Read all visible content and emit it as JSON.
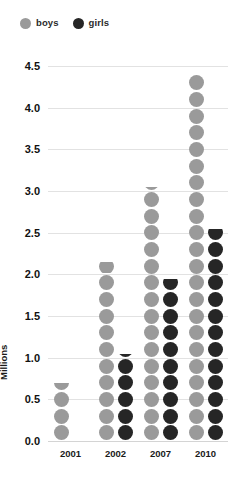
{
  "chart_data": {
    "type": "scatter",
    "title": "",
    "subtitle": "",
    "xlabel": "",
    "ylabel": "Millions",
    "categories": [
      "2001",
      "2002",
      "2007",
      "2010"
    ],
    "ylim": [
      0.0,
      4.5
    ],
    "ytick_labels": [
      "0.0",
      "0.5",
      "1.0",
      "1.5",
      "2.0",
      "2.5",
      "3.0",
      "3.5",
      "4.0",
      "4.5"
    ],
    "ytick_values": [
      0.0,
      0.5,
      1.0,
      1.5,
      2.0,
      2.5,
      3.0,
      3.5,
      4.0,
      4.5
    ],
    "grid": true,
    "legend_position": "top-left",
    "dot_step": 0.2,
    "series": [
      {
        "name": "boys",
        "color": "#9a9a9a",
        "values": [
          0.7,
          2.15,
          3.05,
          4.4
        ]
      },
      {
        "name": "girls",
        "color": "#262626",
        "values": [
          0.0,
          1.05,
          1.95,
          2.55
        ]
      }
    ]
  },
  "legend": {
    "items": [
      {
        "label": "boys",
        "color": "#9a9a9a"
      },
      {
        "label": "girls",
        "color": "#262626"
      }
    ]
  },
  "axes": {
    "y_title": "Millions"
  }
}
